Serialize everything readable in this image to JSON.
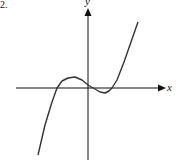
{
  "problem_number": "2.",
  "chart_data": {
    "type": "line",
    "title": "",
    "xlabel": "x",
    "ylabel": "y",
    "grid": false,
    "ticks": false,
    "origin_px": [
      88,
      88
    ],
    "curve_points_px": [
      [
        38,
        155
      ],
      [
        45,
        125
      ],
      [
        52,
        102
      ],
      [
        57,
        88
      ],
      [
        62,
        81
      ],
      [
        68,
        78
      ],
      [
        75,
        77
      ],
      [
        82,
        80
      ],
      [
        88,
        85
      ],
      [
        95,
        89
      ],
      [
        100,
        92
      ],
      [
        105,
        93
      ],
      [
        109,
        91
      ],
      [
        112,
        88
      ],
      [
        117,
        80
      ],
      [
        124,
        62
      ],
      [
        131,
        42
      ],
      [
        138,
        22
      ]
    ],
    "colors": {
      "axis": "#111111",
      "curve": "#333333"
    }
  }
}
